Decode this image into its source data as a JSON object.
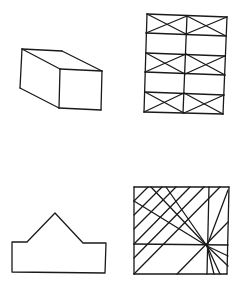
{
  "figures": [
    {
      "id": "box",
      "label": "rectangular prism",
      "description": "3D box drawn in oblique projection",
      "lines": [
        [
          22,
          49,
          62,
          51
        ],
        [
          22,
          49,
          60,
          69
        ],
        [
          62,
          51,
          102,
          71
        ],
        [
          60,
          69,
          102,
          71
        ],
        [
          60,
          69,
          59,
          108
        ],
        [
          102,
          71,
          101,
          110
        ],
        [
          59,
          108,
          101,
          110
        ],
        [
          22,
          49,
          20,
          88
        ],
        [
          20,
          88,
          59,
          108
        ]
      ]
    },
    {
      "id": "braced-grid",
      "label": "braced frame grid",
      "description": "2 columns x 5 rows rectangle grid, rows 1, 3, 5 cross-braced",
      "lines": [
        [
          147,
          14,
          227,
          17
        ],
        [
          146,
          33,
          226,
          36
        ],
        [
          146,
          53,
          225,
          56
        ],
        [
          145,
          72,
          225,
          75
        ],
        [
          145,
          92,
          224,
          95
        ],
        [
          144,
          112,
          223,
          114
        ],
        [
          147,
          14,
          144,
          112
        ],
        [
          227,
          17,
          223,
          114
        ],
        [
          187,
          16,
          183,
          113
        ],
        [
          147,
          14,
          186,
          34
        ],
        [
          146,
          33,
          187,
          16
        ],
        [
          187,
          16,
          226,
          36
        ],
        [
          186,
          34,
          227,
          17
        ],
        [
          146,
          53,
          185,
          74
        ],
        [
          145,
          72,
          186,
          54
        ],
        [
          186,
          54,
          225,
          75
        ],
        [
          185,
          74,
          225,
          56
        ],
        [
          145,
          92,
          184,
          113
        ],
        [
          144,
          112,
          184,
          93
        ],
        [
          184,
          93,
          223,
          114
        ],
        [
          184,
          113,
          224,
          95
        ]
      ]
    },
    {
      "id": "house-outline",
      "label": "peaked outline",
      "description": "rectangle topped by a triangular peak with shoulders",
      "points": "12,242 27,242 55,213 83,243 106,243 105,273 12,272"
    },
    {
      "id": "ray-square",
      "label": "square with parallel and radiating lines",
      "description": "square containing diagonal parallel lines and rays converging at a focal point",
      "lines": [
        [
          134,
          187,
          229,
          187
        ],
        [
          229,
          187,
          227,
          274
        ],
        [
          227,
          274,
          134,
          274
        ],
        [
          134,
          274,
          134,
          187
        ],
        [
          209,
          187,
          207,
          274
        ],
        [
          134,
          244,
          228,
          245
        ],
        [
          134,
          201,
          148,
          187
        ],
        [
          134,
          215,
          162,
          187
        ],
        [
          134,
          229,
          176,
          187
        ],
        [
          134,
          244,
          190,
          187
        ],
        [
          134,
          258,
          204,
          187
        ],
        [
          134,
          274,
          220,
          187
        ],
        [
          177,
          274,
          228,
          222
        ],
        [
          228,
          190,
          207,
          246
        ],
        [
          134,
          201,
          207,
          246
        ],
        [
          151,
          187,
          207,
          246
        ],
        [
          166,
          187,
          207,
          246
        ],
        [
          207,
          246,
          228,
          256
        ],
        [
          207,
          246,
          228,
          266
        ],
        [
          207,
          246,
          220,
          274
        ],
        [
          207,
          246,
          214,
          274
        ]
      ]
    }
  ],
  "colors": {
    "stroke": "#1a1a1a",
    "background": "#ffffff"
  }
}
